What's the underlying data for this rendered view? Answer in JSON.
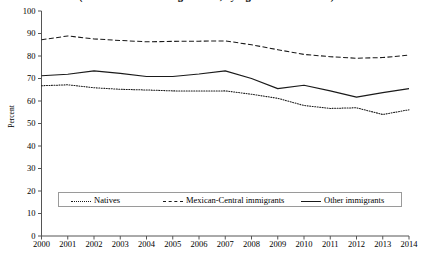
{
  "chart_data": {
    "type": "line",
    "title": "(Share of individuals aged 16-64, by legal status at arrival)",
    "xlabel": "",
    "ylabel": "Percent",
    "ylim": [
      0,
      100
    ],
    "ytick_step": 10,
    "yticks": [
      100,
      90,
      80,
      70,
      60,
      50,
      40,
      30,
      20,
      10,
      0
    ],
    "grid": false,
    "legend_position": "inside-bottom",
    "x": [
      2000,
      2001,
      2002,
      2003,
      2004,
      2005,
      2006,
      2007,
      2008,
      2009,
      2010,
      2011,
      2012,
      2013,
      2014
    ],
    "categories": [
      "2000",
      "2001",
      "2002",
      "2003",
      "2004",
      "2005",
      "2006",
      "2007",
      "2008",
      "2009",
      "2010",
      "2011",
      "2012",
      "2013",
      "2014"
    ],
    "series": [
      {
        "name": "Natives",
        "style": "dotted",
        "color": "#1a1a1a",
        "values": [
          66.8,
          67.2,
          65.9,
          65.2,
          64.9,
          64.5,
          64.4,
          64.5,
          63.0,
          61.2,
          58.0,
          56.7,
          57.0,
          54.0,
          56.1
        ]
      },
      {
        "name": "Mexican-Central immigrants",
        "style": "dashed",
        "color": "#1a1a1a",
        "values": [
          87.2,
          88.9,
          87.6,
          86.9,
          86.3,
          86.5,
          86.6,
          86.7,
          85.0,
          82.8,
          80.7,
          79.7,
          79.0,
          79.3,
          80.4
        ]
      },
      {
        "name": "Other immigrants",
        "style": "solid",
        "color": "#1a1a1a",
        "values": [
          71.2,
          71.9,
          73.4,
          72.3,
          70.9,
          70.9,
          72.0,
          73.4,
          70.0,
          65.5,
          67.0,
          64.5,
          61.7,
          63.7,
          65.5
        ]
      }
    ]
  },
  "legend": {
    "items": [
      {
        "label": "Natives",
        "swatch": "dotted"
      },
      {
        "label": "Mexican-Central immigrants",
        "swatch": "dashed"
      },
      {
        "label": "Other immigrants",
        "swatch": "solid"
      }
    ]
  },
  "axes": {
    "y_label": "Percent",
    "y_ticks": [
      "100",
      "90",
      "80",
      "70",
      "60",
      "50",
      "40",
      "30",
      "20",
      "10",
      "0"
    ],
    "x_ticks": [
      "2000",
      "2001",
      "2002",
      "2003",
      "2004",
      "2005",
      "2006",
      "2007",
      "2008",
      "2009",
      "2010",
      "2011",
      "2012",
      "2013",
      "2014"
    ]
  },
  "colors": {
    "line": "#1a1a1a",
    "axis": "#555555",
    "legend_border": "#9a9a9a",
    "background": "#ffffff"
  }
}
